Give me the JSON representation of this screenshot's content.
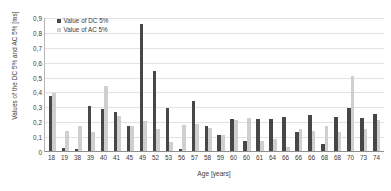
{
  "chart_data": {
    "type": "bar",
    "title": "",
    "xlabel": "Age [years]",
    "ylabel": "Values of the DC 5% and AC 5% [ms]",
    "ylim": [
      0,
      0.9
    ],
    "yticks": [
      "0",
      "0,1",
      "0,2",
      "0,3",
      "0,4",
      "0,5",
      "0,6",
      "0,7",
      "0,8",
      "0,9"
    ],
    "ytick_values": [
      0,
      0.1,
      0.2,
      0.3,
      0.4,
      0.5,
      0.6,
      0.7,
      0.8,
      0.9
    ],
    "grid": true,
    "legend_position": "top-left",
    "categories": [
      "18",
      "19",
      "38",
      "39",
      "40",
      "41",
      "45",
      "49",
      "52",
      "53",
      "56",
      "57",
      "58",
      "59",
      "60",
      "60",
      "61",
      "64",
      "66",
      "66",
      "66",
      "68",
      "68",
      "70",
      "73",
      "74"
    ],
    "series": [
      {
        "name": "Value of DC 5%",
        "color": "#474747",
        "values": [
          0.37,
          0.02,
          0.015,
          0.3,
          0.28,
          0.265,
          0.17,
          0.85,
          0.54,
          0.29,
          0.013,
          0.335,
          0.17,
          0.11,
          0.215,
          0.07,
          0.215,
          0.215,
          0.23,
          0.125,
          0.245,
          0.045,
          0.23,
          0.29,
          0.225,
          0.25
        ]
      },
      {
        "name": "Value of AC 5%",
        "color": "#cfcfcf",
        "values": [
          0.39,
          0.135,
          0.165,
          0.125,
          0.435,
          0.235,
          0.165,
          0.2,
          0.145,
          0.06,
          0.175,
          0.18,
          0.155,
          0.105,
          0.21,
          0.225,
          0.065,
          0.08,
          0.03,
          0.145,
          0.135,
          0.17,
          0.13,
          0.505,
          0.145,
          0.21
        ]
      }
    ]
  },
  "legend": {
    "items": [
      {
        "label": "Value of DC 5%",
        "color": "#474747"
      },
      {
        "label": "Value of AC 5%",
        "color": "#cfcfcf"
      }
    ]
  }
}
